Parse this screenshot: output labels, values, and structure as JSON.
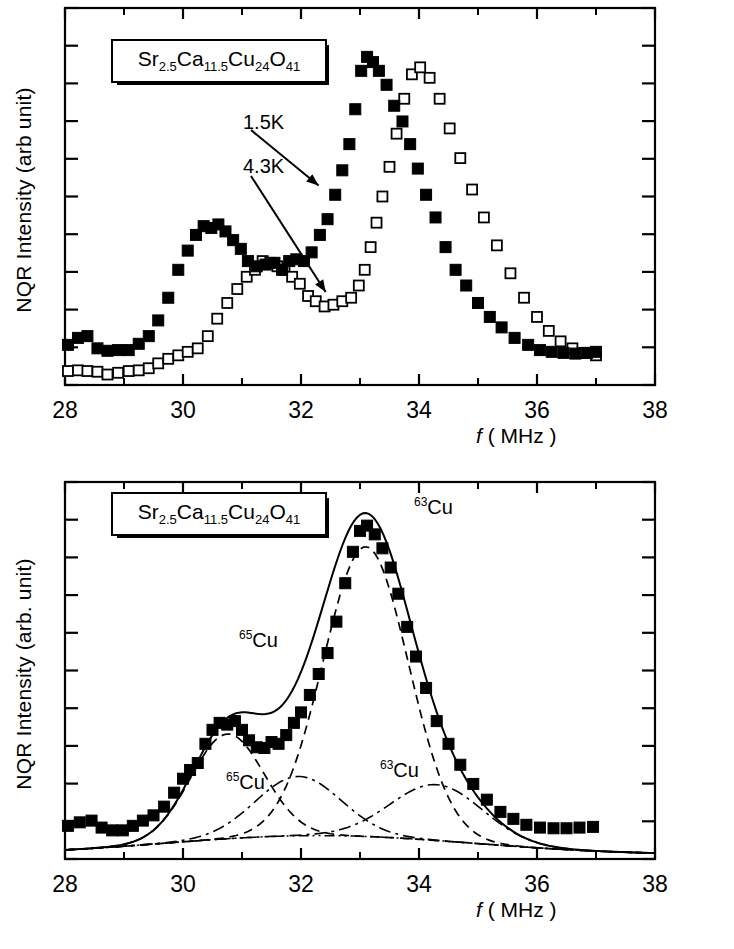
{
  "figure": {
    "panels": [
      {
        "id": "top",
        "ylabel": "NQR Intensity (arb unit)",
        "xlabel_italic": "f",
        "xlabel_rest": "( MHz )",
        "formula_box": "Sr2.5Ca11.5Cu24O41",
        "formula_parts": [
          {
            "t": "Sr",
            "sub": "2.5"
          },
          {
            "t": "Ca",
            "sub": "11.5"
          },
          {
            "t": "Cu",
            "sub": "24"
          },
          {
            "t": "O",
            "sub": "41"
          }
        ],
        "annotations": [
          {
            "name": "temp-1p5k",
            "label": "1.5K"
          },
          {
            "name": "temp-4p3k",
            "label": "4.3K"
          }
        ]
      },
      {
        "id": "bottom",
        "ylabel": "NQR Intensity (arb. unit)",
        "xlabel_italic": "f",
        "xlabel_rest": "( MHz )",
        "formula_box": "Sr2.5Ca11.5Cu24O41",
        "formula_parts": [
          {
            "t": "Sr",
            "sub": "2.5"
          },
          {
            "t": "Ca",
            "sub": "11.5"
          },
          {
            "t": "Cu",
            "sub": "24"
          },
          {
            "t": "O",
            "sub": "41"
          }
        ],
        "annotations": [
          {
            "name": "label-cu63-main",
            "sup": "63",
            "base": "Cu"
          },
          {
            "name": "label-cu65-main",
            "sup": "65",
            "base": "Cu"
          },
          {
            "name": "label-cu65-broad",
            "sup": "65",
            "base": "Cu"
          },
          {
            "name": "label-cu63-broad",
            "sup": "63",
            "base": "Cu"
          }
        ]
      }
    ]
  },
  "chart_data": [
    {
      "type": "scatter",
      "panel": "top",
      "title": "",
      "xlabel": "f ( MHz )",
      "ylabel": "NQR Intensity (arb unit)",
      "xlim": [
        28,
        38
      ],
      "ylim": [
        0,
        1.08
      ],
      "xticks": [
        28,
        30,
        32,
        34,
        36,
        38
      ],
      "xticklabels": [
        "28",
        "30",
        "32",
        "34",
        "36",
        "38"
      ],
      "yticks_unlabeled": 10,
      "grid": false,
      "legend": "arrow annotations",
      "series": [
        {
          "name": "1.5K",
          "marker": "filled-square",
          "x": [
            28.05,
            28.22,
            28.38,
            28.55,
            28.72,
            28.9,
            29.08,
            29.25,
            29.42,
            29.58,
            29.75,
            29.92,
            30.08,
            30.22,
            30.35,
            30.48,
            30.6,
            30.72,
            30.85,
            30.98,
            31.1,
            31.25,
            31.4,
            31.55,
            31.68,
            31.8,
            31.92,
            32.05,
            32.18,
            32.32,
            32.45,
            32.58,
            32.7,
            32.82,
            32.92,
            33.02,
            33.12,
            33.22,
            33.32,
            33.45,
            33.58,
            33.72,
            33.85,
            33.98,
            34.12,
            34.28,
            34.45,
            34.62,
            34.8,
            35.0,
            35.2,
            35.4,
            35.62,
            35.85,
            36.05,
            36.25,
            36.45,
            36.65,
            36.85,
            37.0
          ],
          "y": [
            0.115,
            0.135,
            0.14,
            0.105,
            0.098,
            0.1,
            0.1,
            0.118,
            0.14,
            0.185,
            0.25,
            0.33,
            0.385,
            0.43,
            0.455,
            0.45,
            0.46,
            0.44,
            0.415,
            0.39,
            0.355,
            0.34,
            0.345,
            0.35,
            0.33,
            0.355,
            0.36,
            0.355,
            0.38,
            0.43,
            0.475,
            0.545,
            0.615,
            0.69,
            0.79,
            0.9,
            0.94,
            0.925,
            0.9,
            0.86,
            0.8,
            0.755,
            0.69,
            0.62,
            0.545,
            0.48,
            0.395,
            0.33,
            0.285,
            0.235,
            0.195,
            0.165,
            0.135,
            0.115,
            0.1,
            0.095,
            0.092,
            0.09,
            0.092,
            0.095
          ]
        },
        {
          "name": "4.3K",
          "marker": "open-square",
          "x": [
            28.05,
            28.22,
            28.38,
            28.55,
            28.72,
            28.9,
            29.08,
            29.25,
            29.42,
            29.58,
            29.75,
            29.92,
            30.08,
            30.25,
            30.42,
            30.58,
            30.75,
            30.92,
            31.08,
            31.22,
            31.35,
            31.48,
            31.6,
            31.72,
            31.85,
            31.98,
            32.12,
            32.25,
            32.4,
            32.55,
            32.7,
            32.85,
            32.98,
            33.08,
            33.18,
            33.28,
            33.38,
            33.5,
            33.62,
            33.75,
            33.88,
            34.02,
            34.18,
            34.35,
            34.52,
            34.7,
            34.9,
            35.1,
            35.32,
            35.55,
            35.78,
            36.0,
            36.2,
            36.4,
            36.6,
            36.8,
            37.0
          ],
          "y": [
            0.04,
            0.042,
            0.04,
            0.038,
            0.03,
            0.035,
            0.04,
            0.042,
            0.048,
            0.062,
            0.075,
            0.085,
            0.095,
            0.105,
            0.14,
            0.19,
            0.235,
            0.275,
            0.31,
            0.33,
            0.355,
            0.35,
            0.34,
            0.33,
            0.31,
            0.29,
            0.255,
            0.24,
            0.225,
            0.23,
            0.24,
            0.25,
            0.285,
            0.33,
            0.395,
            0.465,
            0.54,
            0.625,
            0.72,
            0.82,
            0.89,
            0.91,
            0.88,
            0.82,
            0.735,
            0.65,
            0.56,
            0.48,
            0.4,
            0.32,
            0.25,
            0.195,
            0.155,
            0.125,
            0.105,
            0.092,
            0.085
          ]
        }
      ],
      "annotations": [
        {
          "text": "1.5K",
          "points_to_x": 32.45,
          "points_to_y": 0.545
        },
        {
          "text": "4.3K",
          "points_to_x": 32.55,
          "points_to_y": 0.23
        },
        {
          "text": "Sr2.5Ca11.5Cu24O41",
          "role": "sample-label-box"
        }
      ]
    },
    {
      "type": "scatter",
      "panel": "bottom",
      "title": "",
      "xlabel": "f ( MHz )",
      "ylabel": "NQR Intensity (arb. unit)",
      "xlim": [
        28,
        38
      ],
      "ylim": [
        0,
        1.08
      ],
      "xticks": [
        28,
        30,
        32,
        34,
        36,
        38
      ],
      "xticklabels": [
        "28",
        "30",
        "32",
        "34",
        "36",
        "38"
      ],
      "yticks_unlabeled": 10,
      "grid": false,
      "series": [
        {
          "name": "data",
          "marker": "filled-square",
          "x": [
            28.05,
            28.25,
            28.45,
            28.62,
            28.8,
            28.98,
            29.15,
            29.32,
            29.5,
            29.68,
            29.85,
            30.0,
            30.12,
            30.25,
            30.38,
            30.5,
            30.62,
            30.75,
            30.88,
            31.0,
            31.12,
            31.25,
            31.38,
            31.5,
            31.62,
            31.75,
            31.88,
            32.0,
            32.15,
            32.3,
            32.45,
            32.6,
            32.75,
            32.88,
            33.0,
            33.12,
            33.25,
            33.38,
            33.52,
            33.65,
            33.8,
            33.95,
            34.12,
            34.3,
            34.5,
            34.7,
            34.92,
            35.15,
            35.38,
            35.6,
            35.82,
            36.05,
            36.28,
            36.5,
            36.72,
            36.95
          ],
          "y": [
            0.095,
            0.105,
            0.11,
            0.09,
            0.082,
            0.082,
            0.095,
            0.11,
            0.125,
            0.15,
            0.19,
            0.23,
            0.255,
            0.275,
            0.33,
            0.37,
            0.39,
            0.385,
            0.395,
            0.37,
            0.34,
            0.32,
            0.318,
            0.335,
            0.33,
            0.355,
            0.39,
            0.42,
            0.47,
            0.53,
            0.59,
            0.68,
            0.79,
            0.88,
            0.94,
            0.955,
            0.93,
            0.89,
            0.835,
            0.76,
            0.665,
            0.58,
            0.49,
            0.395,
            0.33,
            0.27,
            0.215,
            0.17,
            0.135,
            0.115,
            0.098,
            0.09,
            0.088,
            0.088,
            0.09,
            0.092
          ]
        }
      ],
      "fit_curves": [
        {
          "name": "total-fit",
          "style": "solid",
          "description": "sum of all components"
        },
        {
          "name": "cu65-main",
          "style": "dashed",
          "center": 30.75,
          "amplitude": 0.3,
          "width": 0.62
        },
        {
          "name": "cu63-main",
          "style": "dashed",
          "center": 33.1,
          "amplitude": 0.83,
          "width": 0.72
        },
        {
          "name": "cu65-broad",
          "style": "dash-dot",
          "center": 31.95,
          "amplitude": 0.17,
          "width": 0.72
        },
        {
          "name": "cu63-broad",
          "style": "dash-dot",
          "center": 34.3,
          "amplitude": 0.16,
          "width": 0.78
        },
        {
          "name": "baseline-component",
          "style": "dotted-dash",
          "description": "broad low background hump"
        }
      ],
      "annotations": [
        {
          "text": "63Cu",
          "role": "main-peak-label",
          "x": 33.6,
          "y": 1.0
        },
        {
          "text": "65Cu",
          "role": "main-peak-label",
          "x": 31.0,
          "y": 0.62
        },
        {
          "text": "65Cu",
          "role": "broad-component-label",
          "x": 30.6,
          "y": 0.205
        },
        {
          "text": "63Cu",
          "role": "broad-component-label",
          "x": 33.0,
          "y": 0.235
        },
        {
          "text": "Sr2.5Ca11.5Cu24O41",
          "role": "sample-label-box"
        }
      ]
    }
  ]
}
